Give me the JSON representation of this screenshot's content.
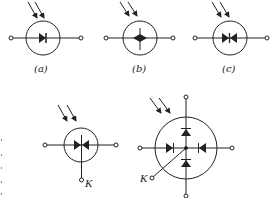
{
  "diagram": {
    "type": "photodiode-symbols",
    "colors": {
      "stroke": "#222222",
      "background": "#ffffff"
    },
    "symbols": [
      {
        "id": "a",
        "label": "(a)",
        "description": "photodiode (single diode, light arrows)"
      },
      {
        "id": "b",
        "label": "(b)",
        "description": "photodiode, diamond junction variant"
      },
      {
        "id": "c",
        "label": "(c)",
        "description": "bidirectional photodiode (back-to-back)"
      },
      {
        "id": "d",
        "label": "",
        "terminal_label": "K",
        "description": "bidirectional photodiode with K terminal"
      },
      {
        "id": "e",
        "label": "",
        "terminal_label": "K",
        "description": "quadrant photodiode with four diodes and K terminal"
      }
    ]
  }
}
